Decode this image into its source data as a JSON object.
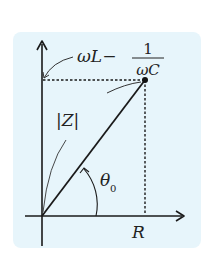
{
  "diagram": {
    "background_color": "#e7f5fb",
    "line_color": "#1a1a1a",
    "labels": {
      "reactance_main": "ωL−",
      "reactance_num": "1",
      "reactance_den": "ωC",
      "magnitude": "|Z|",
      "angle": "θ",
      "angle_sub": "0",
      "resistance": "R"
    },
    "elements": [
      {
        "id": "y-axis",
        "type": "arrow",
        "direction": "up"
      },
      {
        "id": "x-axis",
        "type": "arrow",
        "direction": "right"
      },
      {
        "id": "impedance-vector",
        "type": "line",
        "from": "origin",
        "to": "point"
      },
      {
        "id": "point",
        "type": "dot"
      },
      {
        "id": "dashed-horizontal",
        "type": "dotted-line",
        "to": "y-axis"
      },
      {
        "id": "dashed-vertical",
        "type": "dotted-line",
        "to": "x-axis"
      },
      {
        "id": "angle-arc",
        "type": "arc-arrow",
        "label": "θ0"
      }
    ]
  }
}
